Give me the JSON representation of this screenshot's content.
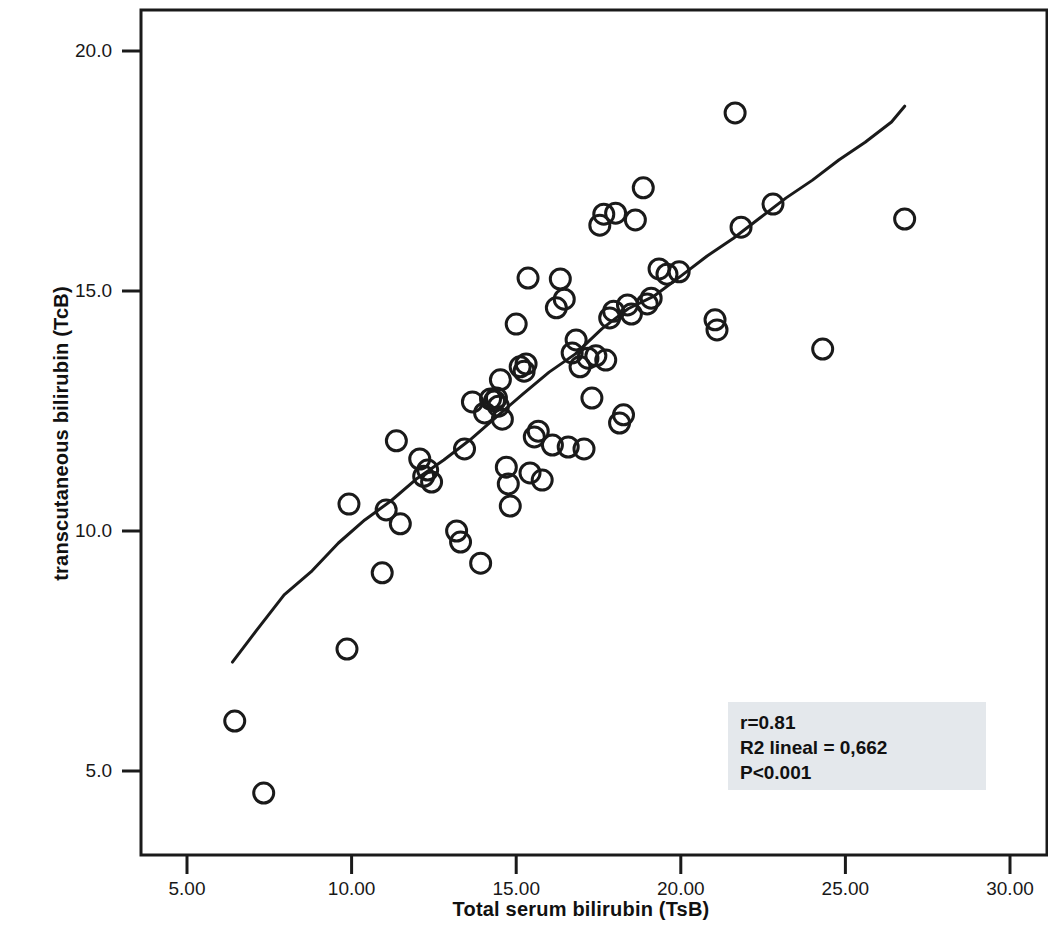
{
  "chart_data": {
    "type": "scatter",
    "title": "",
    "xlabel": "Total serum bilirubin (TsB)",
    "ylabel": "transcutaneous bilirubin (TcB)",
    "xlim": [
      3.5,
      31.5
    ],
    "ylim": [
      3.6,
      20.6
    ],
    "xticks": [
      5,
      10,
      15,
      20,
      25,
      30
    ],
    "xtick_labels": [
      "5.00",
      "10.00",
      "15.00",
      "20.00",
      "25.00",
      "30.00"
    ],
    "yticks": [
      5,
      10,
      15,
      20
    ],
    "ytick_labels": [
      "5.0",
      "10.0",
      "15.0",
      "20.0"
    ],
    "grid": false,
    "legend": null,
    "marker": "open-circle",
    "marker_color": "#1a1a1a",
    "points": [
      [
        6.45,
        6.04
      ],
      [
        7.33,
        4.54
      ],
      [
        9.86,
        7.54
      ],
      [
        9.92,
        10.56
      ],
      [
        10.93,
        9.13
      ],
      [
        11.05,
        10.44
      ],
      [
        11.36,
        11.88
      ],
      [
        11.48,
        10.15
      ],
      [
        12.07,
        11.5
      ],
      [
        12.19,
        11.14
      ],
      [
        12.31,
        11.27
      ],
      [
        12.43,
        11.02
      ],
      [
        13.19,
        10.0
      ],
      [
        13.31,
        9.77
      ],
      [
        13.43,
        11.71
      ],
      [
        13.67,
        12.69
      ],
      [
        13.92,
        9.33
      ],
      [
        14.04,
        12.46
      ],
      [
        14.22,
        12.75
      ],
      [
        14.34,
        12.71
      ],
      [
        14.4,
        12.77
      ],
      [
        14.46,
        12.6
      ],
      [
        14.52,
        13.15
      ],
      [
        14.58,
        12.33
      ],
      [
        14.7,
        11.33
      ],
      [
        14.76,
        10.98
      ],
      [
        14.82,
        10.52
      ],
      [
        15.0,
        14.31
      ],
      [
        15.12,
        13.42
      ],
      [
        15.24,
        13.33
      ],
      [
        15.3,
        13.48
      ],
      [
        15.36,
        15.27
      ],
      [
        15.42,
        11.21
      ],
      [
        15.55,
        11.96
      ],
      [
        15.67,
        12.08
      ],
      [
        15.79,
        11.06
      ],
      [
        16.1,
        11.79
      ],
      [
        16.22,
        14.65
      ],
      [
        16.34,
        15.25
      ],
      [
        16.46,
        14.83
      ],
      [
        16.58,
        11.75
      ],
      [
        16.7,
        13.71
      ],
      [
        16.82,
        13.98
      ],
      [
        16.94,
        13.42
      ],
      [
        17.06,
        11.71
      ],
      [
        17.18,
        13.6
      ],
      [
        17.3,
        12.77
      ],
      [
        17.42,
        13.65
      ],
      [
        17.54,
        16.37
      ],
      [
        17.66,
        16.6
      ],
      [
        17.72,
        13.56
      ],
      [
        17.84,
        14.44
      ],
      [
        17.96,
        14.58
      ],
      [
        18.02,
        16.62
      ],
      [
        18.14,
        12.25
      ],
      [
        18.26,
        12.42
      ],
      [
        18.38,
        14.71
      ],
      [
        18.5,
        14.52
      ],
      [
        18.62,
        16.48
      ],
      [
        18.86,
        17.15
      ],
      [
        18.98,
        14.73
      ],
      [
        19.1,
        14.85
      ],
      [
        19.34,
        15.46
      ],
      [
        19.58,
        15.35
      ],
      [
        19.95,
        15.4
      ],
      [
        21.04,
        14.4
      ],
      [
        21.1,
        14.19
      ],
      [
        21.65,
        18.71
      ],
      [
        21.83,
        16.33
      ],
      [
        22.8,
        16.81
      ],
      [
        24.31,
        13.79
      ],
      [
        26.8,
        16.5
      ]
    ],
    "trend_line": {
      "label": "loess-fit-line",
      "color": "#1a1a1a",
      "points": [
        [
          6.38,
          7.27
        ],
        [
          7.1,
          7.92
        ],
        [
          7.95,
          8.67
        ],
        [
          8.8,
          9.17
        ],
        [
          9.6,
          9.75
        ],
        [
          10.4,
          10.23
        ],
        [
          11.2,
          10.63
        ],
        [
          12.0,
          11.1
        ],
        [
          12.8,
          11.48
        ],
        [
          13.6,
          11.9
        ],
        [
          14.4,
          12.38
        ],
        [
          15.2,
          12.85
        ],
        [
          16.0,
          13.31
        ],
        [
          16.8,
          13.69
        ],
        [
          17.6,
          14.21
        ],
        [
          18.4,
          14.63
        ],
        [
          19.2,
          14.9
        ],
        [
          20.0,
          15.31
        ],
        [
          20.8,
          15.73
        ],
        [
          21.6,
          16.1
        ],
        [
          22.4,
          16.52
        ],
        [
          23.2,
          16.94
        ],
        [
          24.0,
          17.31
        ],
        [
          24.8,
          17.73
        ],
        [
          25.6,
          18.1
        ],
        [
          26.4,
          18.52
        ],
        [
          26.8,
          18.85
        ]
      ]
    },
    "annotations": {
      "correlation": "r=0.81",
      "r_squared": "R2 lineal = 0,662",
      "p_value": "P<0.001",
      "box_color": "#e4e8ec"
    }
  }
}
